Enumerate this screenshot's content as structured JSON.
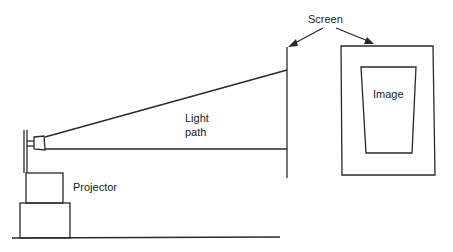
{
  "diagram": {
    "type": "projection-setup",
    "labels": {
      "screen": "Screen",
      "image": "Image",
      "light_path_line1": "Light",
      "light_path_line2": "path",
      "projector": "Projector"
    },
    "colors": {
      "stroke": "#2a2a2a",
      "text": "#1a1a1a",
      "background": "#ffffff"
    }
  }
}
